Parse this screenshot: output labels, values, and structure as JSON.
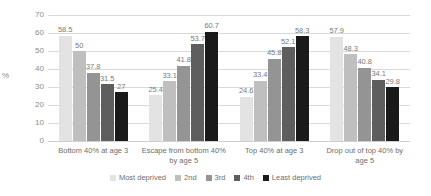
{
  "chart_data": {
    "type": "bar",
    "title": "",
    "xlabel": "",
    "ylabel": "%",
    "ylim": [
      0,
      70
    ],
    "yticks": [
      0,
      10,
      20,
      30,
      40,
      50,
      60,
      70
    ],
    "grid": true,
    "legend_position": "bottom",
    "categories": [
      "Bottom 40% at age 3",
      "Escape from bottom 40% by age 5",
      "Top 40% at age 3",
      "Drop out of top 40% by age 5"
    ],
    "series": [
      {
        "name": "Most deprived",
        "color": "#e3e3e3",
        "values": [
          58.5,
          25.4,
          24.6,
          57.9
        ]
      },
      {
        "name": "2nd",
        "color": "#bfbfbf",
        "values": [
          50,
          33.1,
          33.4,
          48.3
        ]
      },
      {
        "name": "3rd",
        "color": "#949494",
        "values": [
          37.8,
          41.8,
          45.8,
          40.8
        ]
      },
      {
        "name": "4th",
        "color": "#5e5e5e",
        "values": [
          31.5,
          53.7,
          52.1,
          34.1
        ]
      },
      {
        "name": "Least deprived",
        "color": "#1a1a1a",
        "values": [
          27,
          60.7,
          58.3,
          29.8
        ]
      }
    ],
    "data_labels": [
      [
        "58.5",
        "50",
        "37.8",
        "31.5",
        "27"
      ],
      [
        "25.4",
        "33.1",
        "41.8",
        "53.7",
        "60.7"
      ],
      [
        "24.6",
        "33.4",
        "45.8",
        "52.1",
        "58.3"
      ],
      [
        "57.9",
        "48.3",
        "40.8",
        "34.1",
        "29.8"
      ]
    ],
    "category_lines": [
      [
        "Bottom 40% at age 3"
      ],
      [
        "Escape from bottom 40%",
        "by age 5"
      ],
      [
        "Top 40% at age 3"
      ],
      [
        "Drop out of top 40% by",
        "age 5"
      ]
    ]
  }
}
